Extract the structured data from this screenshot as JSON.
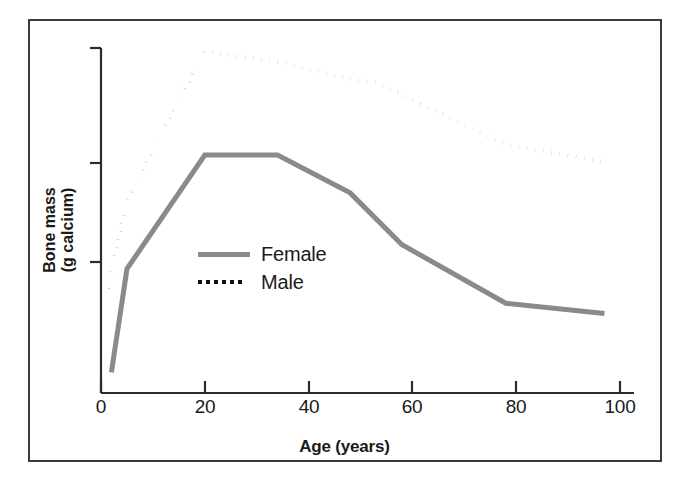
{
  "figure": {
    "border_color": "#3a3a3a",
    "background": "#ffffff"
  },
  "chart_data": {
    "type": "line",
    "title": "",
    "subtitle": "",
    "xlabel": "Age (years)",
    "ylabel": "Bone mass\n(g calcium)",
    "ylabel_line1": "Bone mass",
    "ylabel_line2": "(g calcium)",
    "xlim": [
      0,
      100
    ],
    "ylim": [
      0,
      100
    ],
    "xticks": [
      0,
      20,
      40,
      60,
      80,
      100
    ],
    "xtick_labels": [
      "0",
      "20",
      "40",
      "60",
      "80",
      "100"
    ],
    "yticks": [
      28,
      67,
      100
    ],
    "ytick_labels": [
      "",
      "",
      ""
    ],
    "grid": false,
    "legend_position": "center-left-inside",
    "series": [
      {
        "name": "Female",
        "label": "Female",
        "color": "#8a8a8a",
        "style": "solid",
        "width": 5,
        "x": [
          2,
          5,
          20,
          34,
          48,
          58,
          78,
          97
        ],
        "y": [
          6,
          36,
          69,
          69,
          58,
          43,
          26,
          23
        ]
      },
      {
        "name": "Male",
        "label": "Male",
        "color": "#111111",
        "style": "dotted",
        "width": 4,
        "x": [
          1,
          5,
          20,
          34,
          48,
          53,
          78,
          97
        ],
        "y": [
          28,
          56,
          99,
          96,
          91,
          90,
          72,
          67
        ]
      }
    ]
  },
  "legend": {
    "items": [
      {
        "label": "Female",
        "style": "solid",
        "color": "#8a8a8a"
      },
      {
        "label": "Male",
        "style": "dotted",
        "color": "#111111"
      }
    ]
  },
  "axes": {
    "x_title": "Age (years)",
    "y_title_line1": "Bone mass",
    "y_title_line2": "(g calcium)",
    "x_tick_labels": [
      "0",
      "20",
      "40",
      "60",
      "80",
      "100"
    ]
  }
}
